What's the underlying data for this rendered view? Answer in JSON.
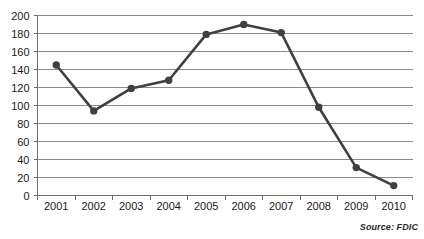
{
  "chart_data": {
    "type": "line",
    "title": "",
    "xlabel": "",
    "ylabel": "",
    "categories": [
      "2001",
      "2002",
      "2003",
      "2004",
      "2005",
      "2006",
      "2007",
      "2008",
      "2009",
      "2010"
    ],
    "values": [
      145,
      94,
      119,
      128,
      179,
      190,
      181,
      98,
      31,
      11
    ],
    "series": [
      {
        "name": "",
        "values": [
          145,
          94,
          119,
          128,
          179,
          190,
          181,
          98,
          31,
          11
        ]
      }
    ],
    "ylim": [
      0,
      200
    ],
    "ytick_labels": [
      "0",
      "20",
      "40",
      "60",
      "80",
      "100",
      "120",
      "140",
      "160",
      "180",
      "200"
    ],
    "ytick_values": [
      0,
      20,
      40,
      60,
      80,
      100,
      120,
      140,
      160,
      180,
      200
    ],
    "xtick_labels": [
      "2001",
      "2002",
      "2003",
      "2004",
      "2005",
      "2006",
      "2007",
      "2008",
      "2009",
      "2010"
    ],
    "grid": true,
    "legend": false,
    "legend_position": "none",
    "marker": "circle",
    "line_color": "#404040",
    "marker_color": "#404040",
    "grid_color": "#8c8c8c",
    "annotations": [
      {
        "name": "source-note",
        "text": "Source: FDIC"
      }
    ]
  },
  "source": {
    "label": "Source: FDIC"
  }
}
